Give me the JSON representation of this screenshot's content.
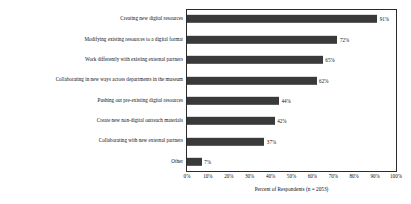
{
  "chart_data": {
    "type": "bar",
    "orientation": "horizontal",
    "title": "",
    "subtitle": "",
    "xlabel": "Percent of Respondents (n = 2053)",
    "ylabel": "",
    "xlim": [
      0,
      100
    ],
    "grid": false,
    "legend": null,
    "categories": [
      "Creating new digital resources",
      "Modifying existing resources to a digital format",
      "Work differently with existing external partners",
      "Collaborating in new ways across departments in the museum",
      "Pushing out pre-existing digital resources",
      "Create new non-digital outreach materials",
      "Collaborating with new external partners",
      "Other"
    ],
    "values": [
      91,
      72,
      65,
      62,
      44,
      42,
      37,
      7
    ],
    "value_labels": [
      "91%",
      "72%",
      "65%",
      "62%",
      "44%",
      "42%",
      "37%",
      "7%"
    ],
    "xticks": [
      0,
      10,
      20,
      30,
      40,
      50,
      60,
      70,
      80,
      90,
      100
    ],
    "xtick_labels": [
      "0%",
      "10%",
      "20%",
      "30%",
      "40%",
      "50%",
      "60%",
      "70%",
      "80%",
      "90%",
      "100%"
    ],
    "bar_color": "#3a3a3a",
    "frame_color": "#2b2b2b",
    "background_color": "#ffffff"
  }
}
